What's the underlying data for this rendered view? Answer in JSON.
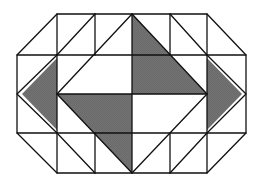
{
  "figure": {
    "title": "Octagonal quilt-block tiling pattern",
    "colors": {
      "background": "#ffffff",
      "stroke": "#111111",
      "shade": "#707070"
    },
    "grid": {
      "x": [
        17,
        57,
        95,
        132,
        170,
        207,
        246
      ],
      "y": [
        14,
        55,
        94,
        133,
        173
      ]
    },
    "shaded_regions": [
      {
        "name": "left-triangle",
        "points": "57,58 22,94 57,130"
      },
      {
        "name": "center-top-right-quadrant",
        "points": "132,14 207,94 132,94"
      },
      {
        "name": "center-bottom-left-quadrant",
        "points": "57,94 132,94 132,173"
      },
      {
        "name": "right-triangle",
        "points": "207,58 242,94 207,130"
      }
    ]
  }
}
